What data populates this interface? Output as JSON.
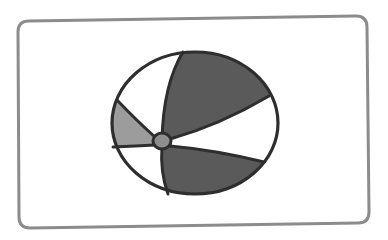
{
  "image": {
    "subject": "beach-ball",
    "description": "Illustration of a beach ball inside a rounded rectangular frame"
  },
  "colors": {
    "background": "#ffffff",
    "frame_stroke": "#8c8c8c",
    "outline": "#2e2e2e",
    "panel_dark": "#5a5a5a",
    "panel_light_gray": "#9c9c9c",
    "panel_white": "#ffffff",
    "hub": "#8e8e8e"
  },
  "icons": {
    "main": "beach-ball-icon"
  }
}
